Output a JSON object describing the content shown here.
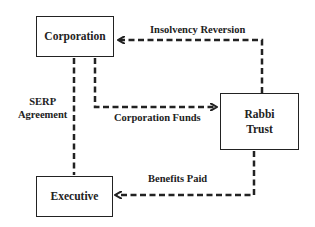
{
  "diagram": {
    "nodes": {
      "corporation": {
        "label": "Corporation"
      },
      "rabbi_trust": {
        "label_line1": "Rabbi",
        "label_line2": "Trust"
      },
      "executive": {
        "label": "Executive"
      }
    },
    "edges": {
      "insolvency_reversion": {
        "label": "Insolvency Reversion",
        "from": "Rabbi Trust",
        "to": "Corporation",
        "style": "dashed"
      },
      "serp_agreement": {
        "label_line1": "SERP",
        "label_line2": "Agreement",
        "from": "Corporation",
        "to": "Executive",
        "style": "dashed"
      },
      "corporation_funds": {
        "label": "Corporation Funds",
        "from": "Corporation",
        "to": "Rabbi Trust",
        "style": "dashed"
      },
      "benefits_paid": {
        "label": "Benefits Paid",
        "from": "Rabbi Trust",
        "to": "Executive",
        "style": "dashed"
      }
    },
    "colors": {
      "stroke": "#222222",
      "background": "#ffffff"
    }
  }
}
